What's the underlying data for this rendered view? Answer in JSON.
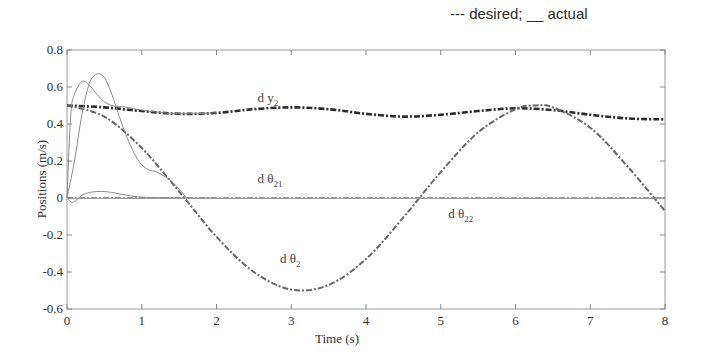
{
  "legend_note": "--- desired; __ actual",
  "chart_data": {
    "type": "line",
    "title": "",
    "xlabel": "Time (s)",
    "ylabel": "Positions (m/s)",
    "xlim": [
      0,
      8
    ],
    "ylim": [
      -0.6,
      0.8
    ],
    "xticks": [
      0,
      1,
      2,
      3,
      4,
      5,
      6,
      7,
      8
    ],
    "yticks": [
      -0.6,
      -0.4,
      -0.2,
      0,
      0.2,
      0.4,
      0.6,
      0.8
    ],
    "ytick_labels": [
      "-0.6",
      "-0.4",
      "-0.2",
      "0",
      "0.2",
      "0.4",
      "0.6",
      "0.8"
    ],
    "grid": false,
    "legend_position": "top-right (text note)",
    "annotations": [
      {
        "text": "d y",
        "sub": "2",
        "x": 2.55,
        "y": 0.52
      },
      {
        "text": "d θ",
        "sub": "21",
        "x": 2.55,
        "y": 0.08
      },
      {
        "text": "d θ",
        "sub": "22",
        "x": 5.1,
        "y": -0.11
      },
      {
        "text": "d θ",
        "sub": "2",
        "x": 2.85,
        "y": -0.35
      }
    ],
    "series": [
      {
        "name": "d y2 desired",
        "style": "dash-dot",
        "color": "#2b2b2b",
        "width": 2.6,
        "x": [
          0,
          0.5,
          1,
          1.5,
          2,
          2.5,
          3,
          3.5,
          4,
          4.5,
          5,
          5.5,
          6,
          6.5,
          7,
          7.5,
          8
        ],
        "y": [
          0.5,
          0.49,
          0.47,
          0.455,
          0.46,
          0.48,
          0.49,
          0.48,
          0.455,
          0.44,
          0.45,
          0.47,
          0.485,
          0.475,
          0.45,
          0.43,
          0.425
        ]
      },
      {
        "name": "d y2 actual",
        "style": "solid",
        "color": "#8a8a8a",
        "width": 1,
        "x": [
          0,
          0.05,
          0.1,
          0.2,
          0.3,
          0.4,
          0.5,
          0.6,
          0.7,
          0.8,
          1.0,
          1.2,
          1.5,
          2.0
        ],
        "y": [
          0,
          0.45,
          0.56,
          0.63,
          0.61,
          0.56,
          0.52,
          0.5,
          0.495,
          0.49,
          0.475,
          0.465,
          0.455,
          0.46
        ]
      },
      {
        "name": "d theta2 desired",
        "style": "dash-dot",
        "color": "#666666",
        "width": 2,
        "x": [
          0,
          0.5,
          1,
          1.5,
          2,
          2.5,
          3,
          3.5,
          4,
          4.5,
          5,
          5.5,
          6,
          6.28,
          6.5,
          7,
          7.5,
          8
        ],
        "y": [
          0.5,
          0.44,
          0.27,
          0.035,
          -0.21,
          -0.4,
          -0.495,
          -0.47,
          -0.33,
          -0.105,
          0.14,
          0.355,
          0.48,
          0.5,
          0.49,
          0.38,
          0.17,
          -0.07
        ]
      },
      {
        "name": "d theta2 actual",
        "style": "solid",
        "color": "#8a8a8a",
        "width": 1,
        "x": [
          0,
          0.1,
          0.2,
          0.3,
          0.4,
          0.5,
          0.6,
          0.7,
          0.8,
          0.9,
          1.0,
          1.1,
          1.2,
          1.4,
          1.6
        ],
        "y": [
          0,
          0.2,
          0.45,
          0.62,
          0.67,
          0.65,
          0.56,
          0.44,
          0.33,
          0.24,
          0.18,
          0.15,
          0.14,
          0.09,
          0.0
        ]
      },
      {
        "name": "d theta21 desired",
        "style": "dash-dot",
        "color": "#777777",
        "width": 1.6,
        "x": [
          0,
          8
        ],
        "y": [
          0,
          0
        ]
      },
      {
        "name": "d theta21 actual",
        "style": "solid",
        "color": "#8a8a8a",
        "width": 1,
        "x": [
          0,
          0.05,
          0.1,
          0.2,
          0.3,
          0.4,
          0.5,
          0.6,
          0.8,
          1.0,
          1.3,
          1.6,
          2.0
        ],
        "y": [
          0,
          -0.02,
          -0.02,
          0.015,
          0.03,
          0.035,
          0.035,
          0.03,
          0.015,
          0.005,
          0.002,
          0,
          0
        ]
      },
      {
        "name": "d theta22 actual",
        "style": "solid",
        "color": "#9a9a9a",
        "width": 1,
        "x": [
          0,
          2,
          4,
          6,
          8
        ],
        "y": [
          -0.002,
          -0.003,
          -0.002,
          -0.003,
          -0.002
        ]
      }
    ]
  }
}
